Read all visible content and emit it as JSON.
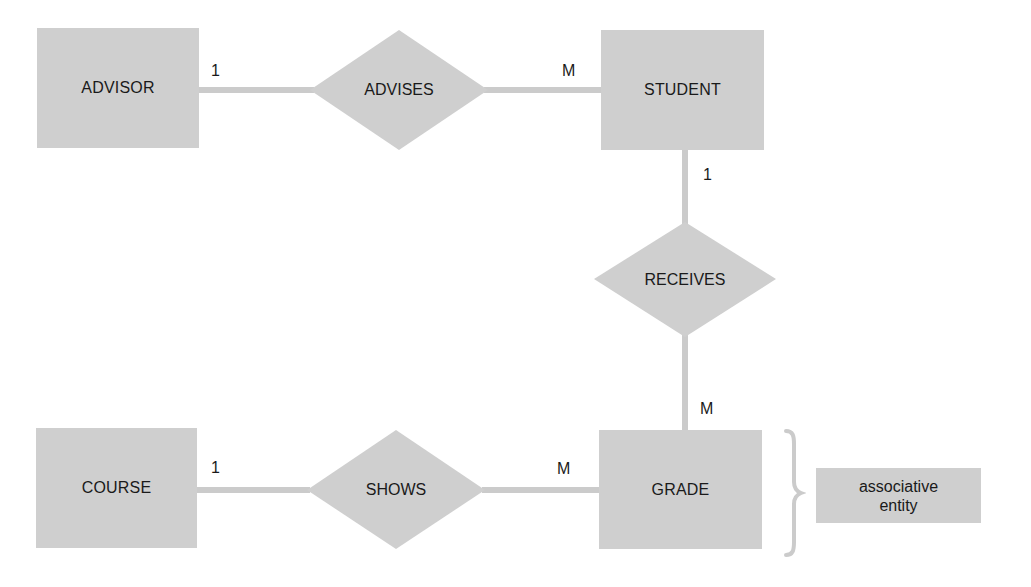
{
  "diagram": {
    "type": "entity-relationship",
    "colors": {
      "shape_fill": "#cfcfcf",
      "line": "#cbcbcb",
      "text": "#1a1a1a",
      "background": "#ffffff"
    },
    "entities": [
      {
        "id": "advisor",
        "label": "ADVISOR"
      },
      {
        "id": "student",
        "label": "STUDENT"
      },
      {
        "id": "course",
        "label": "COURSE"
      },
      {
        "id": "grade",
        "label": "GRADE"
      }
    ],
    "relationships": [
      {
        "id": "advises",
        "label": "ADVISES",
        "from": "advisor",
        "to": "student",
        "from_card": "1",
        "to_card": "M"
      },
      {
        "id": "receives",
        "label": "RECEIVES",
        "from": "student",
        "to": "grade",
        "from_card": "1",
        "to_card": "M"
      },
      {
        "id": "shows",
        "label": "SHOWS",
        "from": "course",
        "to": "grade",
        "from_card": "1",
        "to_card": "M"
      }
    ],
    "annotation": {
      "target": "grade",
      "line1": "associative",
      "line2": "entity",
      "brace": "right-curly-brace"
    }
  }
}
